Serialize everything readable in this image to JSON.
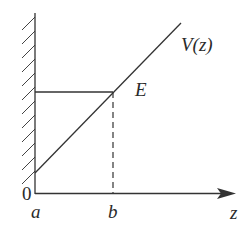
{
  "diagram": {
    "labels": {
      "origin": "0",
      "a": "a",
      "b": "b",
      "z_axis": "z",
      "energy": "E",
      "potential": "V(z)"
    },
    "elements": {
      "wall": "hatched vertical wall at z = a",
      "potential_line": "linear V(z) rising from wall",
      "energy_level": "horizontal line E from wall to turning point",
      "turning_point": "dashed vertical line at z = b"
    },
    "colors": {
      "stroke": "#333333",
      "background": "#ffffff"
    }
  }
}
